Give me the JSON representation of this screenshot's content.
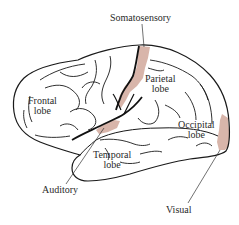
{
  "diagram": {
    "colors": {
      "outline": "#1a1a1a",
      "shaded_area": "#d8b5aa",
      "label_text": "#2a2a2a",
      "background": "#ffffff"
    },
    "lobes": {
      "frontal": {
        "line1": "Frontal",
        "line2": "lobe"
      },
      "parietal": {
        "line1": "Parietal",
        "line2": "lobe"
      },
      "occipital": {
        "line1": "Occipital",
        "line2": "lobe"
      },
      "temporal": {
        "line1": "Temporal",
        "line2": "lobe"
      }
    },
    "sensory_areas": {
      "somatosensory": {
        "label": "Somatosensory"
      },
      "auditory": {
        "label": "Auditory"
      },
      "visual": {
        "label": "Visual"
      }
    }
  }
}
